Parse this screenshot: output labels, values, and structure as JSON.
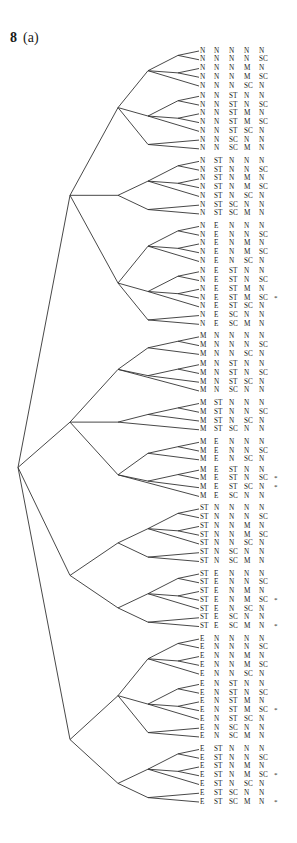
{
  "figure": {
    "number": "8",
    "panel": "(a)"
  },
  "chart_data": {
    "type": "tree",
    "columns": 5,
    "leaves": [
      {
        "labels": [
          "N",
          "N",
          "N",
          "N",
          "N"
        ],
        "marked": false
      },
      {
        "labels": [
          "N",
          "N",
          "N",
          "N",
          "SC"
        ],
        "marked": false
      },
      {
        "labels": [
          "N",
          "N",
          "N",
          "M",
          "N"
        ],
        "marked": false
      },
      {
        "labels": [
          "N",
          "N",
          "N",
          "M",
          "SC"
        ],
        "marked": false
      },
      {
        "labels": [
          "N",
          "N",
          "N",
          "SC",
          "N"
        ],
        "marked": false
      },
      {
        "labels": [
          "N",
          "N",
          "ST",
          "N",
          "N"
        ],
        "marked": false
      },
      {
        "labels": [
          "N",
          "N",
          "ST",
          "N",
          "SC"
        ],
        "marked": false
      },
      {
        "labels": [
          "N",
          "N",
          "ST",
          "M",
          "N"
        ],
        "marked": false
      },
      {
        "labels": [
          "N",
          "N",
          "ST",
          "M",
          "SC"
        ],
        "marked": false
      },
      {
        "labels": [
          "N",
          "N",
          "ST",
          "SC",
          "N"
        ],
        "marked": false
      },
      {
        "labels": [
          "N",
          "N",
          "SC",
          "N",
          "N"
        ],
        "marked": false
      },
      {
        "labels": [
          "N",
          "N",
          "SC",
          "M",
          "N"
        ],
        "marked": false
      },
      {
        "labels": [
          "N",
          "ST",
          "N",
          "N",
          "N"
        ],
        "marked": false
      },
      {
        "labels": [
          "N",
          "ST",
          "N",
          "N",
          "SC"
        ],
        "marked": false
      },
      {
        "labels": [
          "N",
          "ST",
          "N",
          "M",
          "N"
        ],
        "marked": false
      },
      {
        "labels": [
          "N",
          "ST",
          "N",
          "M",
          "SC"
        ],
        "marked": false
      },
      {
        "labels": [
          "N",
          "ST",
          "N",
          "SC",
          "N"
        ],
        "marked": false
      },
      {
        "labels": [
          "N",
          "ST",
          "SC",
          "N",
          "N"
        ],
        "marked": false
      },
      {
        "labels": [
          "N",
          "ST",
          "SC",
          "M",
          "N"
        ],
        "marked": false
      },
      {
        "labels": [
          "N",
          "E",
          "N",
          "N",
          "N"
        ],
        "marked": false
      },
      {
        "labels": [
          "N",
          "E",
          "N",
          "N",
          "SC"
        ],
        "marked": false
      },
      {
        "labels": [
          "N",
          "E",
          "N",
          "M",
          "N"
        ],
        "marked": false
      },
      {
        "labels": [
          "N",
          "E",
          "N",
          "M",
          "SC"
        ],
        "marked": false
      },
      {
        "labels": [
          "N",
          "E",
          "N",
          "SC",
          "N"
        ],
        "marked": false
      },
      {
        "labels": [
          "N",
          "E",
          "ST",
          "N",
          "N"
        ],
        "marked": false
      },
      {
        "labels": [
          "N",
          "E",
          "ST",
          "N",
          "SC"
        ],
        "marked": false
      },
      {
        "labels": [
          "N",
          "E",
          "ST",
          "M",
          "N"
        ],
        "marked": false
      },
      {
        "labels": [
          "N",
          "E",
          "ST",
          "M",
          "SC"
        ],
        "marked": true
      },
      {
        "labels": [
          "N",
          "E",
          "ST",
          "SC",
          "N"
        ],
        "marked": false
      },
      {
        "labels": [
          "N",
          "E",
          "SC",
          "N",
          "N"
        ],
        "marked": false
      },
      {
        "labels": [
          "N",
          "E",
          "SC",
          "M",
          "N"
        ],
        "marked": false
      },
      {
        "labels": [
          "M",
          "N",
          "N",
          "N",
          "N"
        ],
        "marked": false
      },
      {
        "labels": [
          "M",
          "N",
          "N",
          "N",
          "SC"
        ],
        "marked": false
      },
      {
        "labels": [
          "M",
          "N",
          "N",
          "SC",
          "N"
        ],
        "marked": false
      },
      {
        "labels": [
          "M",
          "N",
          "ST",
          "N",
          "N"
        ],
        "marked": false
      },
      {
        "labels": [
          "M",
          "N",
          "ST",
          "N",
          "SC"
        ],
        "marked": false
      },
      {
        "labels": [
          "M",
          "N",
          "ST",
          "SC",
          "N"
        ],
        "marked": false
      },
      {
        "labels": [
          "M",
          "N",
          "SC",
          "N",
          "N"
        ],
        "marked": false
      },
      {
        "labels": [
          "M",
          "ST",
          "N",
          "N",
          "N"
        ],
        "marked": false
      },
      {
        "labels": [
          "M",
          "ST",
          "N",
          "N",
          "SC"
        ],
        "marked": false
      },
      {
        "labels": [
          "M",
          "ST",
          "N",
          "SC",
          "N"
        ],
        "marked": false
      },
      {
        "labels": [
          "M",
          "ST",
          "SC",
          "N",
          "N"
        ],
        "marked": false
      },
      {
        "labels": [
          "M",
          "E",
          "N",
          "N",
          "N"
        ],
        "marked": false
      },
      {
        "labels": [
          "M",
          "E",
          "N",
          "N",
          "SC"
        ],
        "marked": false
      },
      {
        "labels": [
          "M",
          "E",
          "N",
          "SC",
          "N"
        ],
        "marked": false
      },
      {
        "labels": [
          "M",
          "E",
          "ST",
          "N",
          "N"
        ],
        "marked": false
      },
      {
        "labels": [
          "M",
          "E",
          "ST",
          "N",
          "SC"
        ],
        "marked": true
      },
      {
        "labels": [
          "M",
          "E",
          "ST",
          "SC",
          "N"
        ],
        "marked": true
      },
      {
        "labels": [
          "M",
          "E",
          "SC",
          "N",
          "N"
        ],
        "marked": false
      },
      {
        "labels": [
          "ST",
          "N",
          "N",
          "N",
          "N"
        ],
        "marked": false
      },
      {
        "labels": [
          "ST",
          "N",
          "N",
          "N",
          "SC"
        ],
        "marked": false
      },
      {
        "labels": [
          "ST",
          "N",
          "N",
          "M",
          "N"
        ],
        "marked": false
      },
      {
        "labels": [
          "ST",
          "N",
          "N",
          "M",
          "SC"
        ],
        "marked": false
      },
      {
        "labels": [
          "ST",
          "N",
          "N",
          "SC",
          "N"
        ],
        "marked": false
      },
      {
        "labels": [
          "ST",
          "N",
          "SC",
          "N",
          "N"
        ],
        "marked": false
      },
      {
        "labels": [
          "ST",
          "N",
          "SC",
          "M",
          "N"
        ],
        "marked": false
      },
      {
        "labels": [
          "ST",
          "E",
          "N",
          "N",
          "N"
        ],
        "marked": false
      },
      {
        "labels": [
          "ST",
          "E",
          "N",
          "N",
          "SC"
        ],
        "marked": false
      },
      {
        "labels": [
          "ST",
          "E",
          "N",
          "M",
          "N"
        ],
        "marked": false
      },
      {
        "labels": [
          "ST",
          "E",
          "N",
          "M",
          "SC"
        ],
        "marked": true
      },
      {
        "labels": [
          "ST",
          "E",
          "N",
          "SC",
          "N"
        ],
        "marked": false
      },
      {
        "labels": [
          "ST",
          "E",
          "SC",
          "N",
          "N"
        ],
        "marked": false
      },
      {
        "labels": [
          "ST",
          "E",
          "SC",
          "M",
          "N"
        ],
        "marked": true
      },
      {
        "labels": [
          "E",
          "N",
          "N",
          "N",
          "N"
        ],
        "marked": false
      },
      {
        "labels": [
          "E",
          "N",
          "N",
          "N",
          "SC"
        ],
        "marked": false
      },
      {
        "labels": [
          "E",
          "N",
          "N",
          "M",
          "N"
        ],
        "marked": false
      },
      {
        "labels": [
          "E",
          "N",
          "N",
          "M",
          "SC"
        ],
        "marked": false
      },
      {
        "labels": [
          "E",
          "N",
          "N",
          "SC",
          "N"
        ],
        "marked": false
      },
      {
        "labels": [
          "E",
          "N",
          "ST",
          "N",
          "N"
        ],
        "marked": false
      },
      {
        "labels": [
          "E",
          "N",
          "ST",
          "N",
          "SC"
        ],
        "marked": false
      },
      {
        "labels": [
          "E",
          "N",
          "ST",
          "M",
          "N"
        ],
        "marked": false
      },
      {
        "labels": [
          "E",
          "N",
          "ST",
          "M",
          "SC"
        ],
        "marked": true
      },
      {
        "labels": [
          "E",
          "N",
          "ST",
          "SC",
          "N"
        ],
        "marked": false
      },
      {
        "labels": [
          "E",
          "N",
          "SC",
          "N",
          "N"
        ],
        "marked": false
      },
      {
        "labels": [
          "E",
          "N",
          "SC",
          "M",
          "N"
        ],
        "marked": false
      },
      {
        "labels": [
          "E",
          "ST",
          "N",
          "N",
          "N"
        ],
        "marked": false
      },
      {
        "labels": [
          "E",
          "ST",
          "N",
          "N",
          "SC"
        ],
        "marked": false
      },
      {
        "labels": [
          "E",
          "ST",
          "N",
          "M",
          "N"
        ],
        "marked": false
      },
      {
        "labels": [
          "E",
          "ST",
          "N",
          "M",
          "SC"
        ],
        "marked": true
      },
      {
        "labels": [
          "E",
          "ST",
          "N",
          "SC",
          "N"
        ],
        "marked": false
      },
      {
        "labels": [
          "E",
          "ST",
          "SC",
          "N",
          "N"
        ],
        "marked": false
      },
      {
        "labels": [
          "E",
          "ST",
          "SC",
          "M",
          "N"
        ],
        "marked": true
      }
    ],
    "marker_symbol": "*",
    "line_color": "#333333"
  }
}
